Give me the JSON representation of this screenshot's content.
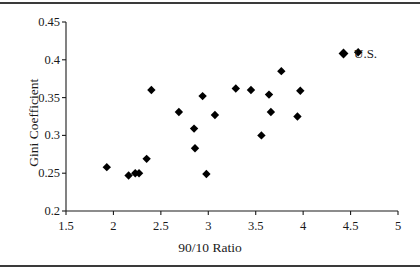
{
  "chart_data": {
    "type": "scatter",
    "title": "",
    "xlabel": "90/10 Ratio",
    "ylabel": "Gini Coefficient",
    "xlim": [
      1.5,
      5
    ],
    "ylim": [
      0.2,
      0.45
    ],
    "xticks": [
      "1.5",
      "2",
      "2.5",
      "3",
      "3.5",
      "4",
      "4.5",
      "5"
    ],
    "xtick_values": [
      1.5,
      2,
      2.5,
      3,
      3.5,
      4,
      4.5,
      5
    ],
    "yticks": [
      "0.2",
      "0.25",
      "0.3",
      "0.35",
      "0.4",
      "0.45"
    ],
    "ytick_values": [
      0.2,
      0.25,
      0.3,
      0.35,
      0.4,
      0.45
    ],
    "grid": false,
    "legend_position": "top-right",
    "marker": "diamond",
    "marker_color": "#000000",
    "series": [
      {
        "name": "U.S.",
        "points": [
          [
            1.93,
            0.258
          ],
          [
            2.16,
            0.247
          ],
          [
            2.23,
            0.25
          ],
          [
            2.27,
            0.25
          ],
          [
            2.35,
            0.269
          ],
          [
            2.4,
            0.36
          ],
          [
            2.69,
            0.331
          ],
          [
            2.85,
            0.309
          ],
          [
            2.86,
            0.283
          ],
          [
            2.94,
            0.352
          ],
          [
            2.98,
            0.249
          ],
          [
            3.07,
            0.327
          ],
          [
            3.29,
            0.362
          ],
          [
            3.45,
            0.36
          ],
          [
            3.56,
            0.3
          ],
          [
            3.64,
            0.354
          ],
          [
            3.66,
            0.331
          ],
          [
            3.77,
            0.385
          ],
          [
            3.94,
            0.325
          ],
          [
            3.97,
            0.359
          ],
          [
            4.58,
            0.41
          ]
        ]
      }
    ],
    "legend": [
      {
        "label": "U.S.",
        "marker": "diamond",
        "color": "#000000"
      }
    ]
  }
}
